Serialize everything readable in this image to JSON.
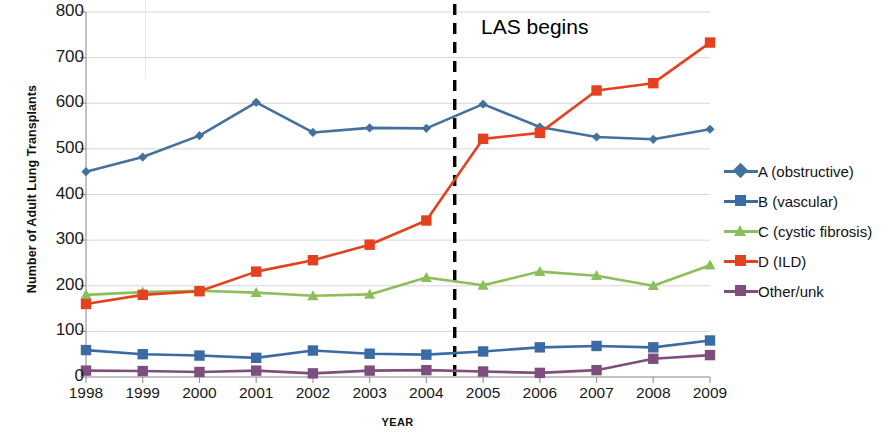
{
  "chart_data": {
    "type": "line",
    "title": "",
    "xlabel": "YEAR",
    "ylabel": "Number of Adult Lung Transplants",
    "categories": [
      "1998",
      "1999",
      "2000",
      "2001",
      "2002",
      "2003",
      "2004",
      "2005",
      "2006",
      "2007",
      "2008",
      "2009"
    ],
    "x": [
      1998,
      1999,
      2000,
      2001,
      2002,
      2003,
      2004,
      2005,
      2006,
      2007,
      2008,
      2009
    ],
    "ylim": [
      0,
      800
    ],
    "yticks": [
      0,
      100,
      200,
      300,
      400,
      500,
      600,
      700,
      800
    ],
    "grid": "horizontal",
    "legend_position": "right",
    "series": [
      {
        "name": "A (obstructive)",
        "color": "#44719E",
        "marker": "diamond",
        "values": [
          450,
          482,
          529,
          602,
          536,
          546,
          545,
          598,
          548,
          526,
          521,
          543
        ]
      },
      {
        "name": "B (vascular)",
        "color": "#3A6BA5",
        "marker": "square",
        "values": [
          59,
          50,
          47,
          42,
          58,
          51,
          49,
          56,
          65,
          68,
          65,
          80
        ]
      },
      {
        "name": "C (cystic fibrosis)",
        "color": "#8CBF5B",
        "marker": "triangle",
        "values": [
          180,
          186,
          189,
          185,
          178,
          181,
          218,
          201,
          231,
          222,
          200,
          245
        ]
      },
      {
        "name": "D (ILD)",
        "color": "#E3411F",
        "marker": "square",
        "values": [
          160,
          180,
          188,
          231,
          256,
          290,
          343,
          522,
          535,
          628,
          644,
          733
        ]
      },
      {
        "name": "Other/unk",
        "color": "#7E4F7E",
        "marker": "square",
        "values": [
          14,
          13,
          11,
          14,
          8,
          14,
          15,
          12,
          9,
          15,
          40,
          48
        ]
      }
    ],
    "annotations": [
      {
        "text": "LAS begins",
        "x_position": 2004.5,
        "marker_type": "vertical-dashed-line",
        "color": "#000000"
      }
    ]
  }
}
